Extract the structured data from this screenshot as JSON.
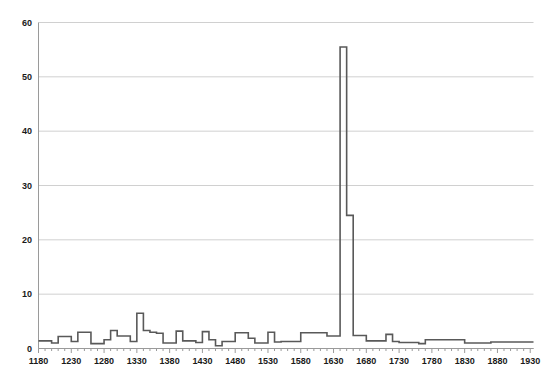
{
  "chart_data": {
    "type": "line",
    "title": "",
    "subtitle": "",
    "xlabel": "",
    "ylabel": "",
    "xlim": [
      1180,
      1935
    ],
    "ylim": [
      0,
      60
    ],
    "grid": "horizontal",
    "legend": "none",
    "line_color": "#595959",
    "gridline_color": "#d0d0d0",
    "axis_color": "#9a9a9a",
    "yticks": [
      0,
      10,
      20,
      30,
      40,
      50,
      60
    ],
    "ytick_labels": [
      "0",
      "10",
      "20",
      "30",
      "40",
      "50",
      "60"
    ],
    "xticks": [
      1180,
      1230,
      1280,
      1330,
      1380,
      1430,
      1480,
      1530,
      1580,
      1630,
      1680,
      1730,
      1780,
      1830,
      1880,
      1930
    ],
    "xtick_labels": [
      "1180",
      "1230",
      "1280",
      "1330",
      "1380",
      "1430",
      "1480",
      "1530",
      "1580",
      "1630",
      "1680",
      "1730",
      "1780",
      "1830",
      "1880",
      "1930"
    ],
    "minor_xtick_step": 10,
    "step_style": "post",
    "x": [
      1180,
      1190,
      1200,
      1210,
      1220,
      1230,
      1240,
      1250,
      1260,
      1270,
      1280,
      1290,
      1300,
      1310,
      1320,
      1330,
      1340,
      1350,
      1360,
      1370,
      1380,
      1390,
      1400,
      1410,
      1420,
      1430,
      1440,
      1450,
      1460,
      1470,
      1480,
      1490,
      1500,
      1510,
      1520,
      1530,
      1540,
      1550,
      1560,
      1570,
      1580,
      1590,
      1600,
      1610,
      1620,
      1630,
      1640,
      1650,
      1660,
      1670,
      1680,
      1690,
      1700,
      1710,
      1720,
      1730,
      1740,
      1750,
      1760,
      1770,
      1780,
      1790,
      1800,
      1810,
      1820,
      1830,
      1840,
      1850,
      1860,
      1870,
      1880,
      1890,
      1900,
      1910,
      1920,
      1930
    ],
    "values": [
      1.4,
      1.4,
      1.0,
      2.2,
      2.2,
      1.3,
      3.0,
      3.0,
      0.9,
      0.9,
      1.6,
      3.3,
      2.3,
      2.3,
      1.3,
      6.5,
      3.3,
      3.0,
      2.8,
      1.0,
      1.0,
      3.2,
      1.4,
      1.4,
      1.1,
      3.1,
      1.6,
      0.5,
      1.3,
      1.3,
      2.9,
      2.9,
      1.9,
      1.0,
      1.0,
      3.0,
      1.2,
      1.3,
      1.3,
      1.3,
      2.9,
      2.9,
      2.9,
      2.9,
      2.3,
      2.3,
      55.5,
      24.5,
      2.4,
      2.4,
      1.4,
      1.4,
      1.4,
      2.6,
      1.3,
      1.1,
      1.1,
      1.1,
      0.9,
      1.6,
      1.6,
      1.6,
      1.6,
      1.6,
      1.6,
      1.0,
      1.0,
      1.0,
      1.0,
      1.2,
      1.2,
      1.2,
      1.2,
      1.2,
      1.2,
      1.2
    ],
    "peak": {
      "x": 1640,
      "y": 55.5
    },
    "secondary_peak": {
      "x": 1650,
      "y": 24.5
    }
  }
}
